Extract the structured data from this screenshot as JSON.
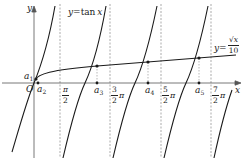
{
  "figure": {
    "axes": {
      "x_label": "x",
      "y_label": "y",
      "origin_label": "O"
    },
    "curves": [
      {
        "name": "tan",
        "label_prefix": "y=",
        "label_func": "tan",
        "label_var": "x"
      },
      {
        "name": "sqrt",
        "label_prefix": "y=",
        "label_num": "√x",
        "label_den": "10"
      }
    ],
    "asymptote_ticks": [
      {
        "num": "π",
        "den": "2",
        "suffix": ""
      },
      {
        "num": "3",
        "den": "2",
        "suffix": "π"
      },
      {
        "num": "5",
        "den": "2",
        "suffix": "π"
      },
      {
        "num": "7",
        "den": "2",
        "suffix": "π"
      }
    ],
    "points": [
      {
        "label": "a",
        "sub": "1"
      },
      {
        "label": "a",
        "sub": "2"
      },
      {
        "label": "a",
        "sub": "3"
      },
      {
        "label": "a",
        "sub": "4"
      },
      {
        "label": "a",
        "sub": "5"
      }
    ],
    "colors": {
      "curve": "#1a1a1a",
      "axis": "#555555",
      "asymptote": "#888888"
    }
  }
}
